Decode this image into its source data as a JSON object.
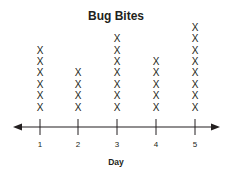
{
  "chart_data": {
    "type": "line_plot",
    "title": "Bug Bites",
    "xlabel": "Day",
    "ylabel": "",
    "categories": [
      "1",
      "2",
      "3",
      "4",
      "5"
    ],
    "values": [
      6,
      4,
      7,
      5,
      8
    ],
    "marker": "X",
    "axis": {
      "arrows": "both",
      "ticks": [
        "1",
        "2",
        "3",
        "4",
        "5"
      ]
    },
    "grid": false,
    "legend": null
  }
}
